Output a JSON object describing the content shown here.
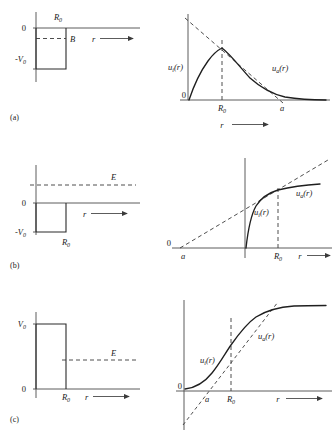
{
  "figure": {
    "panels": [
      {
        "tag": "(a)",
        "potential": {
          "type": "attractive-square-well",
          "depth_label": "-V",
          "depth_sub": "0",
          "zero_label": "0",
          "radius_label": "R",
          "radius_sub": "0",
          "level_label": "B",
          "axis_label": "r"
        },
        "wavefunction": {
          "zero_label": "0",
          "inner_label": "u",
          "inner_sub": "i",
          "inner_arg": "(r)",
          "outer_label": "u",
          "outer_sub": "a",
          "outer_arg": "(r)",
          "radius_label": "R",
          "radius_sub": "0",
          "scattering_label": "a",
          "axis_label": "r",
          "description": "Bound state: u_i rises from origin, peaks near R0, decays exponentially; dashed asymptote crosses axis at a > R0"
        }
      },
      {
        "tag": "(b)",
        "potential": {
          "type": "attractive-square-well",
          "depth_label": "-V",
          "depth_sub": "0",
          "zero_label": "0",
          "radius_label": "R",
          "radius_sub": "0",
          "level_label": "E",
          "axis_label": "r"
        },
        "wavefunction": {
          "zero_label": "0",
          "inner_label": "u",
          "inner_sub": "i",
          "inner_arg": "(r)",
          "outer_label": "u",
          "outer_sub": "a",
          "outer_arg": "(r)",
          "radius_label": "R",
          "radius_sub": "0",
          "scattering_label": "a",
          "axis_label": "r",
          "description": "Positive energy: u_i rises steeply and joins u_a; dashed asymptote intercepts axis at negative a"
        }
      },
      {
        "tag": "(c)",
        "potential": {
          "type": "repulsive-square-barrier",
          "height_label": "V",
          "height_sub": "0",
          "zero_label": "0",
          "radius_label": "R",
          "radius_sub": "0",
          "level_label": "E",
          "axis_label": "r"
        },
        "wavefunction": {
          "zero_label": "0",
          "inner_label": "u",
          "inner_sub": "i",
          "inner_arg": "(r)",
          "outer_label": "u",
          "outer_sub": "a",
          "outer_arg": "(r)",
          "radius_label": "R",
          "radius_sub": "0",
          "scattering_label": "a",
          "axis_label": "r",
          "description": "Repulsive barrier: S-shaped curve from origin; dashed asymptote crosses axis at positive a < R0"
        }
      }
    ],
    "colors": {
      "ink": "#1a1a1a",
      "curve": "#1f1f1f",
      "axis": "#4a4a4a",
      "dash": "#3a3a3a",
      "background": "#ffffff"
    }
  }
}
